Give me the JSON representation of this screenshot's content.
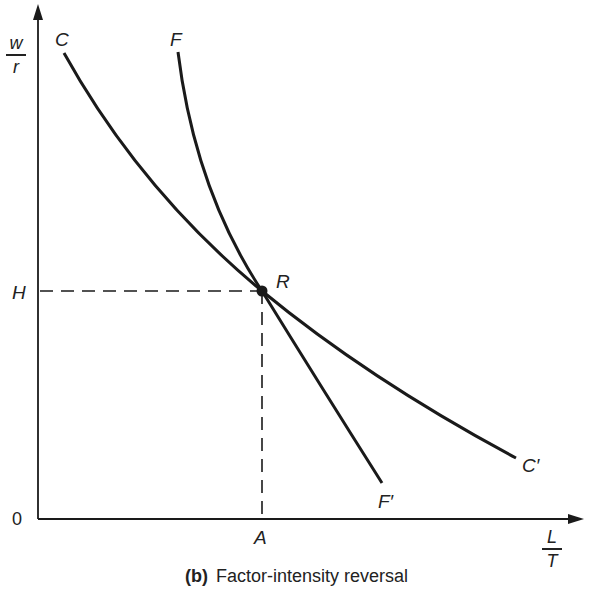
{
  "figure": {
    "caption_tag": "(b)",
    "caption_text": "Factor-intensity reversal"
  },
  "axes": {
    "y_label_num": "w",
    "y_label_den": "r",
    "x_label_num": "L",
    "x_label_den": "T",
    "origin": "0"
  },
  "labels": {
    "curve_c_start": "C",
    "curve_c_end": "C′",
    "curve_f_start": "F",
    "curve_f_end": "F′",
    "intersection": "R",
    "h_level": "H",
    "a_level": "A"
  },
  "colors": {
    "ink": "#1a1a1a",
    "background": "#ffffff"
  }
}
